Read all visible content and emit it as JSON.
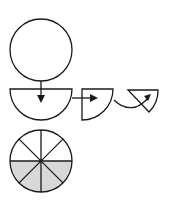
{
  "diagram": {
    "steps": [
      {
        "name": "whole-circle",
        "fraction": "1"
      },
      {
        "name": "half-circle",
        "fraction": "1/2"
      },
      {
        "name": "quarter-circle",
        "fraction": "1/4"
      },
      {
        "name": "eighth-circle",
        "fraction": "1/8"
      }
    ],
    "divided_circle": {
      "sectors": 8,
      "shaded_sectors": 4,
      "shaded_fraction": "4/8"
    },
    "colors": {
      "stroke": "#1a1a1a",
      "shade": "#d8d8d8",
      "background": "#ffffff"
    }
  }
}
